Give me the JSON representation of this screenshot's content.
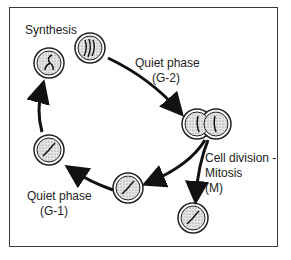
{
  "diagram": {
    "labels": {
      "synthesis": "Synthesis",
      "g2_line1": "Quiet phase",
      "g2_line2": "(G-2)",
      "g1_line1": "Quiet phase",
      "g1_line2": "(G-1)",
      "mitosis_line1": "Cell division -",
      "mitosis_line2": "Mitosis",
      "mitosis_line3": "(M)"
    },
    "stages": [
      "Synthesis",
      "Quiet phase (G-2)",
      "Cell division - Mitosis (M)",
      "Quiet phase (G-1)"
    ],
    "colors": {
      "stroke": "#222222",
      "cell_fill": "#d8d8d8",
      "background": "#ffffff"
    }
  }
}
